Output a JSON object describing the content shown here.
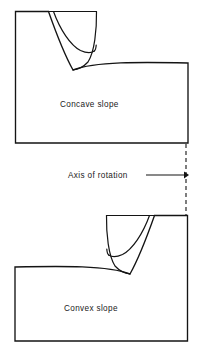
{
  "figure": {
    "background_color": "#ffffff",
    "line_color": "#141414",
    "text_color": "#1a1a1a",
    "labels": {
      "concave": "Concave slope",
      "convex": "Convex slope",
      "axis": "Axis of rotation"
    },
    "panels": [
      {
        "name": "concave-slope-panel",
        "label": "Concave slope",
        "description": "Upper block with a concave excavated slope face on its upper left, two nested arc lines within the slope, and a gently rising ground surface to the right."
      },
      {
        "name": "convex-slope-panel",
        "label": "Convex slope",
        "description": "Lower block, mirrored horizontally, with a convex slope face on its upper right, two nested arc lines within the slope, and a gently rising ground surface to the left."
      }
    ],
    "axis_of_rotation": {
      "label": "Axis of rotation",
      "style": "dashed vertical line",
      "x_position": 186,
      "y_from": 144,
      "y_to": 216,
      "arrow": "points right toward the dashed axis line"
    }
  }
}
